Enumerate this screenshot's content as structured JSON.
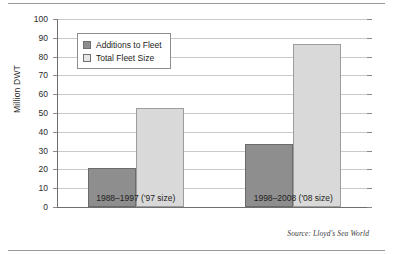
{
  "chart_data": {
    "type": "bar",
    "title": "",
    "subtitle": "",
    "xlabel": "",
    "ylabel": "Million DWT",
    "ylim": [
      0,
      100
    ],
    "ytick_step": 10,
    "yticks": [
      100,
      90,
      80,
      70,
      60,
      50,
      40,
      30,
      20,
      10,
      0
    ],
    "ytick_labels": [
      "100",
      "90",
      "80",
      "70",
      "60",
      "50",
      "40",
      "30",
      "20",
      "10",
      "0"
    ],
    "grid": true,
    "grid_axis": "y",
    "legend_position": "upper-left-inside",
    "categories": [
      "1988–1997 ('97 size)",
      "1998–2008 ('08 size)"
    ],
    "series": [
      {
        "name": "Additions to Fleet",
        "color": "#8e8e8e",
        "values": [
          21,
          33.5
        ]
      },
      {
        "name": "Total Fleet Size",
        "color": "#d9d9d9",
        "values": [
          52.8,
          86.5
        ]
      }
    ],
    "annotations": [
      {
        "name": "source-note",
        "text": "Source: Lloyd's Sea World"
      }
    ]
  },
  "figure": {
    "source_note": "Source: Lloyd's Sea World"
  }
}
